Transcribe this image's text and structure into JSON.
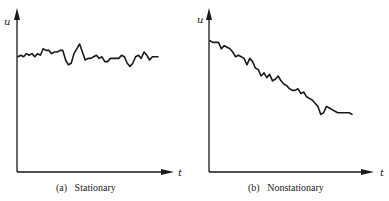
{
  "chart_data": [
    {
      "type": "line",
      "title": "",
      "caption_tag": "(a)",
      "caption": "Stationary",
      "xlabel": "t",
      "ylabel": "u",
      "grid": false,
      "legend": "none",
      "xlim": [
        0,
        100
      ],
      "ylim": [
        0,
        100
      ],
      "series": [
        {
          "name": "u(t) stationary",
          "x": [
            0,
            2,
            4,
            6,
            8,
            10,
            12,
            14,
            16,
            18,
            20,
            22,
            24,
            26,
            28,
            30,
            32,
            34,
            36,
            38,
            40,
            42,
            44,
            46,
            48,
            50,
            52,
            54,
            56,
            58,
            60,
            62,
            64,
            66,
            68,
            70,
            72,
            74,
            76,
            78,
            80,
            82,
            84,
            86,
            88,
            90,
            92,
            94,
            96,
            98,
            100
          ],
          "values": [
            72,
            73,
            72,
            74,
            73,
            74,
            72,
            74,
            73,
            77,
            76,
            76,
            74,
            75,
            75,
            76,
            76,
            70,
            67,
            68,
            74,
            77,
            80,
            75,
            70,
            71,
            71,
            72,
            73,
            71,
            72,
            69,
            69,
            71,
            71,
            71,
            71,
            73,
            72,
            68,
            66,
            68,
            72,
            73,
            71,
            75,
            73,
            70,
            72,
            72,
            72
          ]
        }
      ]
    },
    {
      "type": "line",
      "title": "",
      "caption_tag": "(b)",
      "caption": "Nonstationary",
      "xlabel": "t",
      "ylabel": "u",
      "grid": false,
      "legend": "none",
      "xlim": [
        0,
        100
      ],
      "ylim": [
        0,
        100
      ],
      "series": [
        {
          "name": "u(t) nonstationary",
          "x": [
            0,
            2,
            4,
            6,
            8,
            10,
            12,
            14,
            16,
            18,
            20,
            22,
            24,
            26,
            28,
            30,
            32,
            34,
            36,
            38,
            40,
            42,
            44,
            46,
            48,
            50,
            52,
            54,
            56,
            58,
            60,
            62,
            64,
            66,
            68,
            70,
            72,
            74,
            76,
            78,
            80,
            82,
            84,
            86,
            88,
            90,
            92,
            94,
            96,
            98,
            100
          ],
          "values": [
            82,
            81,
            81,
            81,
            77,
            79,
            78,
            77,
            75,
            72,
            73,
            72,
            71,
            67,
            71,
            69,
            65,
            64,
            60,
            62,
            59,
            61,
            57,
            58,
            60,
            57,
            55,
            54,
            52,
            51,
            51,
            52,
            49,
            50,
            47,
            46,
            45,
            43,
            41,
            36,
            37,
            41,
            40,
            39,
            38,
            37,
            37,
            37,
            37,
            37,
            36
          ]
        }
      ]
    }
  ]
}
